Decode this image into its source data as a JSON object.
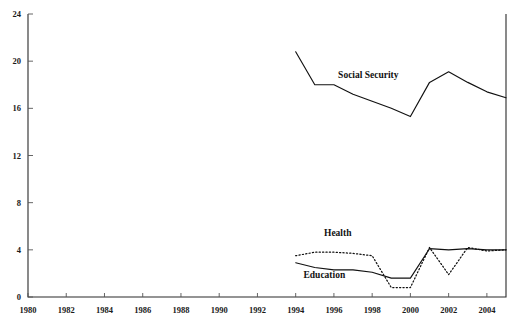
{
  "chart_data": {
    "type": "line",
    "title": "",
    "subtitle": "",
    "xlabel": "",
    "ylabel": "",
    "xlim": [
      1980,
      2005
    ],
    "ylim": [
      0,
      24
    ],
    "grid": false,
    "legend_position": "inline-labels",
    "x_tick_labels": [
      "1980",
      "1982",
      "1984",
      "1986",
      "1988",
      "1990",
      "1992",
      "1994",
      "1996",
      "1998",
      "2000",
      "2002",
      "2004"
    ],
    "x_ticks": [
      1980,
      1982,
      1984,
      1986,
      1988,
      1990,
      1992,
      1994,
      1996,
      1998,
      2000,
      2002,
      2004
    ],
    "y_tick_labels": [
      "0",
      "4",
      "8",
      "12",
      "16",
      "20",
      "24"
    ],
    "y_ticks": [
      0,
      4,
      8,
      12,
      16,
      20,
      24
    ],
    "series": [
      {
        "name": "Social Security",
        "style": "solid",
        "color": "#111111",
        "label_x": 1997.8,
        "label_y": 18.6,
        "x": [
          1994,
          1995,
          1996,
          1997,
          1998,
          1999,
          2000,
          2001,
          2002,
          2003,
          2004,
          2005
        ],
        "values": [
          20.8,
          18.0,
          18.0,
          17.2,
          16.6,
          16.0,
          15.3,
          18.2,
          19.1,
          18.2,
          17.4,
          16.9
        ]
      },
      {
        "name": "Health",
        "style": "dotted",
        "color": "#111111",
        "label_x": 1996.2,
        "label_y": 5.2,
        "x": [
          1994,
          1995,
          1996,
          1997,
          1998,
          1999,
          2000,
          2001,
          2002,
          2003,
          2004,
          2005
        ],
        "values": [
          3.5,
          3.8,
          3.8,
          3.7,
          3.5,
          0.8,
          0.8,
          4.2,
          1.9,
          4.2,
          3.9,
          4.0
        ]
      },
      {
        "name": "Education",
        "style": "solid",
        "color": "#111111",
        "label_x": 1995.5,
        "label_y": 1.6,
        "x": [
          1994,
          1995,
          1996,
          1997,
          1998,
          1999,
          2000,
          2001,
          2002,
          2003,
          2004,
          2005
        ],
        "values": [
          2.9,
          2.5,
          2.3,
          2.3,
          2.1,
          1.6,
          1.6,
          4.1,
          4.0,
          4.1,
          4.0,
          4.0
        ]
      }
    ]
  }
}
